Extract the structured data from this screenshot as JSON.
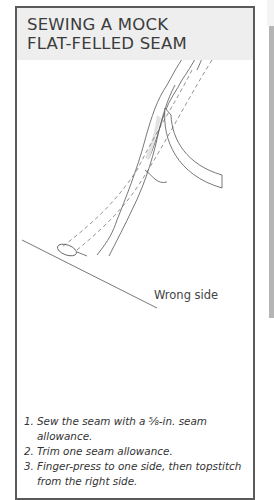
{
  "title": {
    "line1": "SEWING A MOCK",
    "line2": "FLAT-FELLED SEAM"
  },
  "illustration": {
    "label": "Wrong side"
  },
  "steps": [
    {
      "num": "1.",
      "text": "Sew the seam with a ⅝-in. seam allowance."
    },
    {
      "num": "2.",
      "text": "Trim one seam allowance."
    },
    {
      "num": "3.",
      "text": "Finger-press to one side, then topstitch from the right side."
    }
  ],
  "colors": {
    "header_bg": "#eeeeee",
    "border": "#5a5a5a",
    "side_strip": "#b5b5b5"
  }
}
